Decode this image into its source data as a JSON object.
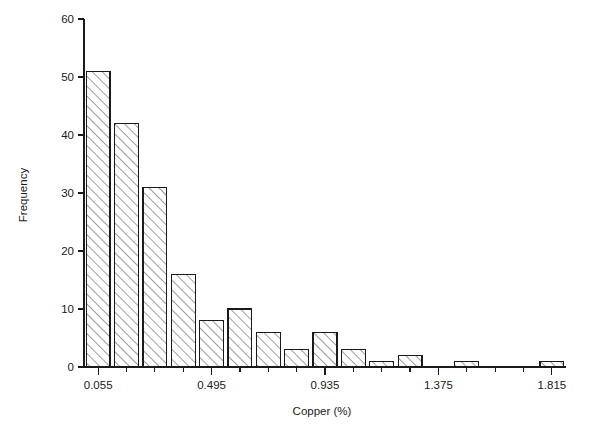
{
  "chart_data": {
    "type": "bar",
    "title": "",
    "subtitle": "",
    "xlabel": "Copper (%)",
    "ylabel": "Frequency",
    "grid": false,
    "legend": false,
    "legend_position": "none",
    "bin_width": 0.11,
    "bin_starts": [
      0.0,
      0.11,
      0.22,
      0.33,
      0.44,
      0.55,
      0.66,
      0.77,
      0.88,
      0.99,
      1.1,
      1.21,
      1.32,
      1.43,
      1.54,
      1.65,
      1.76
    ],
    "categories": [
      "0.055",
      "0.165",
      "0.275",
      "0.385",
      "0.495",
      "0.605",
      "0.715",
      "0.825",
      "0.935",
      "1.045",
      "1.155",
      "1.265",
      "1.375",
      "1.485",
      "1.595",
      "1.705",
      "1.815"
    ],
    "values": [
      51,
      42,
      31,
      16,
      8,
      10,
      6,
      3,
      6,
      3,
      1,
      2,
      0,
      1,
      0,
      0,
      1
    ],
    "xlim": [
      0.0,
      1.87
    ],
    "ylim": [
      0,
      60
    ],
    "ytick_values": [
      0,
      10,
      20,
      30,
      40,
      50,
      60
    ],
    "ytick_labels": [
      "0",
      "10",
      "20",
      "30",
      "40",
      "50",
      "60"
    ],
    "xtick_labels": [
      "0.055",
      "0.495",
      "0.935",
      "1.375",
      "1.815"
    ],
    "xtick_label_values": [
      0.055,
      0.495,
      0.935,
      1.375,
      1.815
    ],
    "xtick_minor_values": [
      0.165,
      0.275,
      0.385,
      0.605,
      0.715,
      0.825,
      1.045,
      1.155,
      1.265,
      1.485,
      1.595,
      1.705
    ],
    "bar_fill": "#ffffff",
    "bar_edge_color": "#1a1a1a",
    "hatch_pattern": "diagonal",
    "background": "#ffffff"
  },
  "axes": {
    "y_title": "Frequency",
    "x_title": "Copper (%)"
  }
}
